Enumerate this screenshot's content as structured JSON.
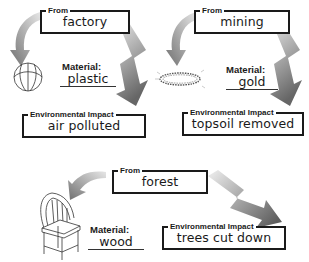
{
  "panels": [
    {
      "id": "plastic",
      "from_label": "From",
      "source": "factory",
      "material_label": "Material:",
      "material": "plastic",
      "impact_label": "Environmental Impact",
      "impact": "air polluted",
      "object_icon": "beach-ball-icon"
    },
    {
      "id": "gold",
      "from_label": "From",
      "source": "mining",
      "material_label": "Material:",
      "material": "gold",
      "impact_label": "Environmental Impact",
      "impact": "topsoil removed",
      "object_icon": "gold-chain-icon"
    },
    {
      "id": "wood",
      "from_label": "From",
      "source": "forest",
      "material_label": "Material:",
      "material": "wood",
      "impact_label": "Environmental Impact",
      "impact": "trees cut down",
      "object_icon": "wooden-chair-icon"
    }
  ],
  "colors": {
    "line": "#1a1a1a",
    "arrow": "#8a8a8a",
    "background": "#ffffff"
  }
}
